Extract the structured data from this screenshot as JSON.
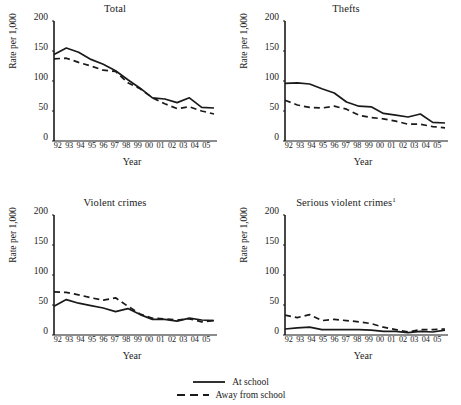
{
  "figure": {
    "axis_label_y": "Rate per 1,000",
    "axis_label_x": "Year",
    "y_ticks": [
      "200",
      "150",
      "100",
      "50",
      "0"
    ],
    "x_ticks": [
      "92",
      "93",
      "94",
      "95",
      "96",
      "97",
      "98",
      "99",
      "00",
      "01",
      "02",
      "03",
      "04",
      "05"
    ],
    "ink_color": "#1a1a1a"
  },
  "legend": {
    "position": "bottom-center",
    "entries": [
      {
        "label": "At school",
        "style": "solid",
        "key": "solid-line-key"
      },
      {
        "label": "Away from school",
        "style": "dashed",
        "key": "dashed-line-key"
      }
    ]
  },
  "panels": [
    {
      "title": "Total",
      "footnote": ""
    },
    {
      "title": "Thefts",
      "footnote": ""
    },
    {
      "title": "Violent crimes",
      "footnote": ""
    },
    {
      "title": "Serious violent crimes",
      "footnote": "1"
    }
  ],
  "chart_data": [
    {
      "type": "line",
      "title": "Total",
      "xlabel": "Year",
      "ylabel": "Rate per 1,000",
      "x": [
        "92",
        "93",
        "94",
        "95",
        "96",
        "97",
        "98",
        "99",
        "00",
        "01",
        "02",
        "03",
        "04",
        "05"
      ],
      "xlim": [
        0,
        13
      ],
      "ylim": [
        0,
        200
      ],
      "yticks": [
        0,
        50,
        100,
        150,
        200
      ],
      "grid": false,
      "series": [
        {
          "name": "At school",
          "style": "solid",
          "values": [
            144,
            155,
            148,
            136,
            128,
            117,
            102,
            88,
            72,
            70,
            64,
            72,
            56,
            55
          ]
        },
        {
          "name": "Away from school",
          "style": "dashed",
          "values": [
            137,
            138,
            131,
            125,
            118,
            116,
            97,
            87,
            72,
            62,
            54,
            57,
            50,
            45
          ]
        }
      ]
    },
    {
      "type": "line",
      "title": "Thefts",
      "xlabel": "Year",
      "ylabel": "Rate per 1,000",
      "x": [
        "92",
        "93",
        "94",
        "95",
        "96",
        "97",
        "98",
        "99",
        "00",
        "01",
        "02",
        "03",
        "04",
        "05"
      ],
      "xlim": [
        0,
        13
      ],
      "ylim": [
        0,
        200
      ],
      "yticks": [
        0,
        50,
        100,
        150,
        200
      ],
      "grid": false,
      "series": [
        {
          "name": "At school",
          "style": "solid",
          "values": [
            96,
            97,
            95,
            87,
            80,
            65,
            58,
            57,
            46,
            43,
            40,
            45,
            31,
            30
          ]
        },
        {
          "name": "Away from school",
          "style": "dashed",
          "values": [
            68,
            60,
            56,
            55,
            58,
            53,
            43,
            39,
            37,
            33,
            28,
            28,
            24,
            22
          ]
        }
      ]
    },
    {
      "type": "line",
      "title": "Violent crimes",
      "xlabel": "Year",
      "ylabel": "Rate per 1,000",
      "x": [
        "92",
        "93",
        "94",
        "95",
        "96",
        "97",
        "98",
        "99",
        "00",
        "01",
        "02",
        "03",
        "04",
        "05"
      ],
      "xlim": [
        0,
        13
      ],
      "ylim": [
        0,
        200
      ],
      "yticks": [
        0,
        50,
        100,
        150,
        200
      ],
      "grid": false,
      "series": [
        {
          "name": "At school",
          "style": "solid",
          "values": [
            48,
            59,
            53,
            49,
            45,
            39,
            44,
            34,
            26,
            26,
            23,
            28,
            25,
            24
          ]
        },
        {
          "name": "Away from school",
          "style": "dashed",
          "values": [
            72,
            71,
            67,
            62,
            58,
            62,
            48,
            35,
            28,
            27,
            25,
            27,
            22,
            24
          ]
        }
      ]
    },
    {
      "type": "line",
      "title": "Serious violent crimes",
      "footnote": "1",
      "xlabel": "Year",
      "ylabel": "Rate per 1,000",
      "x": [
        "92",
        "93",
        "94",
        "95",
        "96",
        "97",
        "98",
        "99",
        "00",
        "01",
        "02",
        "03",
        "04",
        "05"
      ],
      "xlim": [
        0,
        13
      ],
      "ylim": [
        0,
        200
      ],
      "yticks": [
        0,
        50,
        100,
        150,
        200
      ],
      "grid": false,
      "series": [
        {
          "name": "At school",
          "style": "solid",
          "values": [
            10,
            12,
            13,
            9,
            9,
            9,
            9,
            8,
            6,
            6,
            4,
            6,
            5,
            8
          ]
        },
        {
          "name": "Away from school",
          "style": "dashed",
          "values": [
            33,
            29,
            34,
            24,
            26,
            24,
            22,
            19,
            13,
            9,
            5,
            9,
            9,
            10
          ]
        }
      ]
    }
  ]
}
